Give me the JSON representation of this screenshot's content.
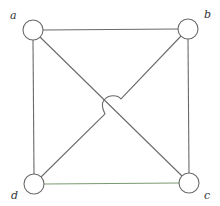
{
  "diagram": {
    "type": "graph",
    "nodes": [
      {
        "id": "a",
        "label": "a",
        "x": 33,
        "y": 30
      },
      {
        "id": "b",
        "label": "b",
        "x": 188,
        "y": 29
      },
      {
        "id": "c",
        "label": "c",
        "x": 189,
        "y": 183
      },
      {
        "id": "d",
        "label": "d",
        "x": 34,
        "y": 184
      }
    ],
    "edges": [
      {
        "from": "a",
        "to": "b"
      },
      {
        "from": "b",
        "to": "c"
      },
      {
        "from": "c",
        "to": "d"
      },
      {
        "from": "d",
        "to": "a"
      },
      {
        "from": "a",
        "to": "c"
      },
      {
        "from": "d",
        "to": "b",
        "crossing": "hop-over a-c"
      }
    ],
    "colors": {
      "edge": "#6a6a6a",
      "edge_bottom": "#7a9a70",
      "node_fill": "#ffffff",
      "label": "#333333"
    }
  }
}
